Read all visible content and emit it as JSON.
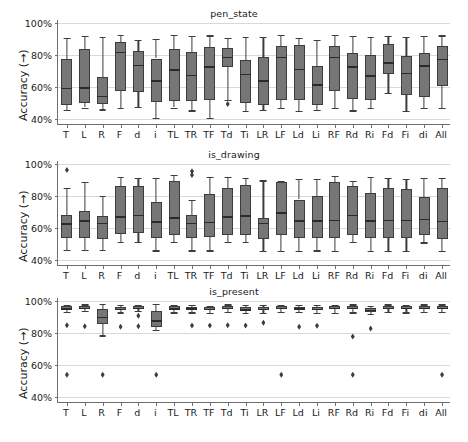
{
  "figure": {
    "width": 468,
    "height": 442,
    "background": "#ffffff",
    "box_fill": "#767676",
    "box_edge": "#3d3d3d",
    "grid_color": "#d9d9d9",
    "axis_color": "#6e6e6e"
  },
  "chart_data": {
    "type": "box",
    "title": "",
    "xlabel": "",
    "ylabel": "Accuracy (→)",
    "ylim": [
      0.36,
      1.02
    ],
    "yticks": [
      0.4,
      0.6,
      0.8,
      1.0
    ],
    "ytick_labels": [
      "40%",
      "60%",
      "80%",
      "100%"
    ],
    "grid": true,
    "legend": "none",
    "categories": [
      "T",
      "L",
      "R",
      "F",
      "d",
      "i",
      "TL",
      "TR",
      "TF",
      "Td",
      "Ti",
      "LR",
      "LF",
      "Ld",
      "Li",
      "RF",
      "Rd",
      "Ri",
      "Fd",
      "Fi",
      "di",
      "All"
    ],
    "panels": [
      {
        "title": "pen_state",
        "boxes": [
          {
            "cat": "T",
            "whislo": 0.455,
            "q1": 0.485,
            "med": 0.595,
            "q3": 0.773,
            "whishi": 0.91,
            "fliers": []
          },
          {
            "cat": "L",
            "whislo": 0.47,
            "q1": 0.498,
            "med": 0.597,
            "q3": 0.84,
            "whishi": 0.918,
            "fliers": []
          },
          {
            "cat": "R",
            "whislo": 0.458,
            "q1": 0.492,
            "med": 0.545,
            "q3": 0.66,
            "whishi": 0.912,
            "fliers": []
          },
          {
            "cat": "F",
            "whislo": 0.468,
            "q1": 0.575,
            "med": 0.822,
            "q3": 0.88,
            "whishi": 0.925,
            "fliers": []
          },
          {
            "cat": "d",
            "whislo": 0.472,
            "q1": 0.565,
            "med": 0.74,
            "q3": 0.828,
            "whishi": 0.897,
            "fliers": []
          },
          {
            "cat": "i",
            "whislo": 0.406,
            "q1": 0.502,
            "med": 0.642,
            "q3": 0.778,
            "whishi": 0.903,
            "fliers": []
          },
          {
            "cat": "TL",
            "whislo": 0.47,
            "q1": 0.512,
            "med": 0.71,
            "q3": 0.835,
            "whishi": 0.927,
            "fliers": []
          },
          {
            "cat": "TR",
            "whislo": 0.452,
            "q1": 0.508,
            "med": 0.675,
            "q3": 0.818,
            "whishi": 0.918,
            "fliers": []
          },
          {
            "cat": "TF",
            "whislo": 0.405,
            "q1": 0.52,
            "med": 0.728,
            "q3": 0.85,
            "whishi": 0.923,
            "fliers": []
          },
          {
            "cat": "Td",
            "whislo": 0.518,
            "q1": 0.722,
            "med": 0.787,
            "q3": 0.843,
            "whishi": 0.905,
            "fliers": [
              0.492
            ]
          },
          {
            "cat": "Ti",
            "whislo": 0.448,
            "q1": 0.497,
            "med": 0.68,
            "q3": 0.768,
            "whishi": 0.915,
            "fliers": []
          },
          {
            "cat": "LR",
            "whislo": 0.453,
            "q1": 0.488,
            "med": 0.64,
            "q3": 0.788,
            "whishi": 0.912,
            "fliers": []
          },
          {
            "cat": "LF",
            "whislo": 0.467,
            "q1": 0.518,
            "med": 0.79,
            "q3": 0.858,
            "whishi": 0.928,
            "fliers": []
          },
          {
            "cat": "Ld",
            "whislo": 0.447,
            "q1": 0.52,
            "med": 0.715,
            "q3": 0.86,
            "whishi": 0.908,
            "fliers": []
          },
          {
            "cat": "Li",
            "whislo": 0.455,
            "q1": 0.487,
            "med": 0.617,
            "q3": 0.732,
            "whishi": 0.897,
            "fliers": []
          },
          {
            "cat": "RF",
            "whislo": 0.465,
            "q1": 0.575,
            "med": 0.79,
            "q3": 0.855,
            "whishi": 0.925,
            "fliers": []
          },
          {
            "cat": "Rd",
            "whislo": 0.452,
            "q1": 0.525,
            "med": 0.728,
            "q3": 0.815,
            "whishi": 0.918,
            "fliers": []
          },
          {
            "cat": "Ri",
            "whislo": 0.465,
            "q1": 0.518,
            "med": 0.672,
            "q3": 0.803,
            "whishi": 0.912,
            "fliers": []
          },
          {
            "cat": "Fd",
            "whislo": 0.562,
            "q1": 0.678,
            "med": 0.755,
            "q3": 0.872,
            "whishi": 0.922,
            "fliers": []
          },
          {
            "cat": "Fi",
            "whislo": 0.447,
            "q1": 0.547,
            "med": 0.69,
            "q3": 0.795,
            "whishi": 0.912,
            "fliers": []
          },
          {
            "cat": "di",
            "whislo": 0.468,
            "q1": 0.537,
            "med": 0.735,
            "q3": 0.81,
            "whishi": 0.918,
            "fliers": []
          },
          {
            "cat": "All",
            "whislo": 0.467,
            "q1": 0.603,
            "med": 0.778,
            "q3": 0.858,
            "whishi": 0.923,
            "fliers": []
          }
        ]
      },
      {
        "title": "is_drawing",
        "boxes": [
          {
            "cat": "T",
            "whislo": 0.462,
            "q1": 0.535,
            "med": 0.628,
            "q3": 0.682,
            "whishi": 0.852,
            "fliers": [
              0.963
            ]
          },
          {
            "cat": "L",
            "whislo": 0.46,
            "q1": 0.533,
            "med": 0.648,
            "q3": 0.707,
            "whishi": 0.888,
            "fliers": []
          },
          {
            "cat": "R",
            "whislo": 0.46,
            "q1": 0.532,
            "med": 0.632,
            "q3": 0.675,
            "whishi": 0.8,
            "fliers": []
          },
          {
            "cat": "F",
            "whislo": 0.513,
            "q1": 0.562,
            "med": 0.673,
            "q3": 0.862,
            "whishi": 0.922,
            "fliers": []
          },
          {
            "cat": "d",
            "whislo": 0.512,
            "q1": 0.567,
            "med": 0.682,
            "q3": 0.862,
            "whishi": 0.912,
            "fliers": []
          },
          {
            "cat": "i",
            "whislo": 0.458,
            "q1": 0.535,
            "med": 0.64,
            "q3": 0.76,
            "whishi": 0.915,
            "fliers": []
          },
          {
            "cat": "TL",
            "whislo": 0.51,
            "q1": 0.553,
            "med": 0.665,
            "q3": 0.893,
            "whishi": 0.932,
            "fliers": []
          },
          {
            "cat": "TR",
            "whislo": 0.458,
            "q1": 0.535,
            "med": 0.633,
            "q3": 0.682,
            "whishi": 0.778,
            "fliers": [
              0.955,
              0.932
            ]
          },
          {
            "cat": "TF",
            "whislo": 0.458,
            "q1": 0.54,
            "med": 0.637,
            "q3": 0.812,
            "whishi": 0.918,
            "fliers": []
          },
          {
            "cat": "Td",
            "whislo": 0.51,
            "q1": 0.552,
            "med": 0.672,
            "q3": 0.852,
            "whishi": 0.922,
            "fliers": []
          },
          {
            "cat": "Ti",
            "whislo": 0.512,
            "q1": 0.552,
            "med": 0.678,
            "q3": 0.868,
            "whishi": 0.915,
            "fliers": []
          },
          {
            "cat": "LR",
            "whislo": 0.455,
            "q1": 0.532,
            "med": 0.63,
            "q3": 0.663,
            "whishi": 0.898,
            "fliers": []
          },
          {
            "cat": "LF",
            "whislo": 0.455,
            "q1": 0.552,
            "med": 0.697,
            "q3": 0.888,
            "whishi": 0.893,
            "fliers": []
          },
          {
            "cat": "Ld",
            "whislo": 0.455,
            "q1": 0.535,
            "med": 0.648,
            "q3": 0.778,
            "whishi": 0.908,
            "fliers": []
          },
          {
            "cat": "Li",
            "whislo": 0.458,
            "q1": 0.535,
            "med": 0.648,
            "q3": 0.797,
            "whishi": 0.905,
            "fliers": []
          },
          {
            "cat": "RF",
            "whislo": 0.457,
            "q1": 0.535,
            "med": 0.65,
            "q3": 0.89,
            "whishi": 0.928,
            "fliers": []
          },
          {
            "cat": "Rd",
            "whislo": 0.513,
            "q1": 0.552,
            "med": 0.682,
            "q3": 0.862,
            "whishi": 0.895,
            "fliers": []
          },
          {
            "cat": "Ri",
            "whislo": 0.455,
            "q1": 0.535,
            "med": 0.648,
            "q3": 0.82,
            "whishi": 0.918,
            "fliers": []
          },
          {
            "cat": "Fd",
            "whislo": 0.455,
            "q1": 0.538,
            "med": 0.65,
            "q3": 0.853,
            "whishi": 0.912,
            "fliers": []
          },
          {
            "cat": "Fi",
            "whislo": 0.453,
            "q1": 0.535,
            "med": 0.65,
            "q3": 0.845,
            "whishi": 0.905,
            "fliers": []
          },
          {
            "cat": "di",
            "whislo": 0.508,
            "q1": 0.553,
            "med": 0.658,
            "q3": 0.795,
            "whishi": 0.912,
            "fliers": []
          },
          {
            "cat": "All",
            "whislo": 0.453,
            "q1": 0.532,
            "med": 0.645,
            "q3": 0.852,
            "whishi": 0.915,
            "fliers": []
          }
        ]
      },
      {
        "title": "is_present",
        "boxes": [
          {
            "cat": "T",
            "whislo": 0.935,
            "q1": 0.948,
            "med": 0.955,
            "q3": 0.968,
            "whishi": 0.978,
            "fliers": [
              0.848,
              0.538
            ]
          },
          {
            "cat": "L",
            "whislo": 0.94,
            "q1": 0.952,
            "med": 0.96,
            "q3": 0.97,
            "whishi": 0.98,
            "fliers": [
              0.843
            ]
          },
          {
            "cat": "R",
            "whislo": 0.785,
            "q1": 0.855,
            "med": 0.903,
            "q3": 0.95,
            "whishi": 0.983,
            "fliers": [
              0.538
            ]
          },
          {
            "cat": "F",
            "whislo": 0.93,
            "q1": 0.945,
            "med": 0.952,
            "q3": 0.965,
            "whishi": 0.978,
            "fliers": [
              0.84
            ]
          },
          {
            "cat": "d",
            "whislo": 0.94,
            "q1": 0.95,
            "med": 0.958,
            "q3": 0.968,
            "whishi": 0.978,
            "fliers": [
              0.908,
              0.842
            ]
          },
          {
            "cat": "i",
            "whislo": 0.818,
            "q1": 0.838,
            "med": 0.88,
            "q3": 0.938,
            "whishi": 0.982,
            "fliers": [
              0.538
            ]
          },
          {
            "cat": "TL",
            "whislo": 0.93,
            "q1": 0.945,
            "med": 0.955,
            "q3": 0.968,
            "whishi": 0.978,
            "fliers": []
          },
          {
            "cat": "TR",
            "whislo": 0.93,
            "q1": 0.945,
            "med": 0.955,
            "q3": 0.965,
            "whishi": 0.978,
            "fliers": [
              0.847
            ]
          },
          {
            "cat": "TF",
            "whislo": 0.925,
            "q1": 0.945,
            "med": 0.953,
            "q3": 0.962,
            "whishi": 0.972,
            "fliers": [
              0.847
            ]
          },
          {
            "cat": "Td",
            "whislo": 0.935,
            "q1": 0.952,
            "med": 0.96,
            "q3": 0.97,
            "whishi": 0.98,
            "fliers": [
              0.848
            ]
          },
          {
            "cat": "Ti",
            "whislo": 0.928,
            "q1": 0.942,
            "med": 0.95,
            "q3": 0.962,
            "whishi": 0.975,
            "fliers": [
              0.847
            ]
          },
          {
            "cat": "LR",
            "whislo": 0.928,
            "q1": 0.942,
            "med": 0.952,
            "q3": 0.965,
            "whishi": 0.977,
            "fliers": [
              0.865
            ]
          },
          {
            "cat": "LF",
            "whislo": 0.932,
            "q1": 0.948,
            "med": 0.957,
            "q3": 0.967,
            "whishi": 0.978,
            "fliers": [
              0.538
            ]
          },
          {
            "cat": "Ld",
            "whislo": 0.932,
            "q1": 0.947,
            "med": 0.955,
            "q3": 0.965,
            "whishi": 0.975,
            "fliers": [
              0.84
            ]
          },
          {
            "cat": "Li",
            "whislo": 0.928,
            "q1": 0.943,
            "med": 0.952,
            "q3": 0.962,
            "whishi": 0.975,
            "fliers": [
              0.845
            ]
          },
          {
            "cat": "RF",
            "whislo": 0.928,
            "q1": 0.952,
            "med": 0.96,
            "q3": 0.968,
            "whishi": 0.978,
            "fliers": []
          },
          {
            "cat": "Rd",
            "whislo": 0.93,
            "q1": 0.95,
            "med": 0.958,
            "q3": 0.967,
            "whishi": 0.98,
            "fliers": [
              0.778,
              0.538
            ]
          },
          {
            "cat": "Ri",
            "whislo": 0.918,
            "q1": 0.933,
            "med": 0.945,
            "q3": 0.958,
            "whishi": 0.97,
            "fliers": [
              0.828
            ]
          },
          {
            "cat": "Fd",
            "whislo": 0.932,
            "q1": 0.95,
            "med": 0.958,
            "q3": 0.968,
            "whishi": 0.98,
            "fliers": []
          },
          {
            "cat": "Fi",
            "whislo": 0.93,
            "q1": 0.948,
            "med": 0.957,
            "q3": 0.967,
            "whishi": 0.978,
            "fliers": []
          },
          {
            "cat": "di",
            "whislo": 0.932,
            "q1": 0.95,
            "med": 0.958,
            "q3": 0.968,
            "whishi": 0.98,
            "fliers": []
          },
          {
            "cat": "All",
            "whislo": 0.935,
            "q1": 0.952,
            "med": 0.96,
            "q3": 0.97,
            "whishi": 0.98,
            "fliers": [
              0.538
            ]
          }
        ]
      }
    ]
  }
}
